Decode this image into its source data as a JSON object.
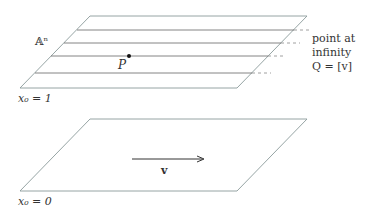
{
  "upper_plane": {
    "label": "𝔸ⁿ",
    "equation": "x₀ = 1",
    "point_label": "P",
    "infinity_text": [
      "point at",
      "infinity",
      "Q = [v]"
    ]
  },
  "lower_plane": {
    "equation": "x₀ = 0",
    "vector_label": "v"
  },
  "colors": {
    "plane_edge": "#8a9a9a",
    "line": "#555555",
    "text": "#333333"
  }
}
